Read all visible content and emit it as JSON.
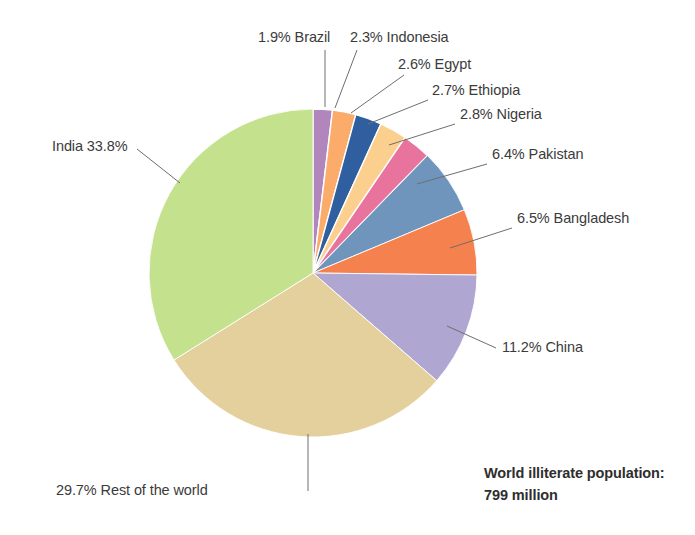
{
  "chart_data": {
    "type": "pie",
    "title": "",
    "subtitle": "",
    "xlabel": "",
    "ylabel": "",
    "legend_position": "none",
    "grid": false,
    "total_label": "World illiterate population:",
    "total_value": "799 million",
    "units": "percent of world illiterate population",
    "categories": [
      "Brazil",
      "Indonesia",
      "Egypt",
      "Ethiopia",
      "Nigeria",
      "Pakistan",
      "Bangladesh",
      "China",
      "Rest of the world",
      "India"
    ],
    "values": [
      1.9,
      2.3,
      2.6,
      2.7,
      2.8,
      6.4,
      6.5,
      11.2,
      29.7,
      33.8
    ],
    "colors": [
      "#b186bd",
      "#fbac6a",
      "#2f5f9e",
      "#fbcf8d",
      "#e8739c",
      "#7095bd",
      "#f5814f",
      "#afa6d2",
      "#e4d09d",
      "#c4e18d"
    ],
    "slices": [
      {
        "name": "Brazil",
        "value": 1.9,
        "label": "1.9% Brazil",
        "color": "#b186bd",
        "start_angle": 0.0,
        "end_angle": 6.84
      },
      {
        "name": "Indonesia",
        "value": 2.3,
        "label": "2.3% Indonesia",
        "color": "#fbac6a",
        "start_angle": 6.84,
        "end_angle": 15.12
      },
      {
        "name": "Egypt",
        "value": 2.6,
        "label": "2.6% Egypt",
        "color": "#2f5f9e",
        "start_angle": 15.12,
        "end_angle": 24.48
      },
      {
        "name": "Ethiopia",
        "value": 2.7,
        "label": "2.7% Ethiopia",
        "color": "#fbcf8d",
        "start_angle": 24.48,
        "end_angle": 34.2
      },
      {
        "name": "Nigeria",
        "value": 2.8,
        "label": "2.8% Nigeria",
        "color": "#e8739c",
        "start_angle": 34.2,
        "end_angle": 44.28
      },
      {
        "name": "Pakistan",
        "value": 6.4,
        "label": "6.4% Pakistan",
        "color": "#7095bd",
        "start_angle": 44.28,
        "end_angle": 67.32
      },
      {
        "name": "Bangladesh",
        "value": 6.5,
        "label": "6.5% Bangladesh",
        "color": "#f5814f",
        "start_angle": 67.32,
        "end_angle": 90.72
      },
      {
        "name": "China",
        "value": 11.2,
        "label": "11.2% China",
        "color": "#afa6d2",
        "start_angle": 90.72,
        "end_angle": 131.04
      },
      {
        "name": "Rest of the world",
        "value": 29.7,
        "label": "29.7% Rest of the world",
        "color": "#e4d09d",
        "start_angle": 131.04,
        "end_angle": 237.96
      },
      {
        "name": "India",
        "value": 33.8,
        "label": "India 33.8%",
        "color": "#c4e18d",
        "start_angle": 237.96,
        "end_angle": 360.0
      }
    ]
  },
  "labels": {
    "brazil": "1.9% Brazil",
    "indonesia": "2.3% Indonesia",
    "egypt": "2.6% Egypt",
    "ethiopia": "2.7% Ethiopia",
    "nigeria": "2.8% Nigeria",
    "pakistan": "6.4% Pakistan",
    "bangladesh": "6.5% Bangladesh",
    "china": "11.2% China",
    "rest_of_world": "29.7% Rest of the world",
    "india": "India 33.8%"
  },
  "caption": {
    "line1": "World illiterate population:",
    "line2": "799 million"
  },
  "style": {
    "background": "#ffffff",
    "text_color": "#3b3b3b",
    "leader_color": "#6e6e6e"
  }
}
